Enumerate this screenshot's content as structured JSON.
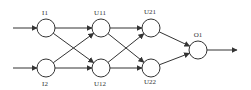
{
  "diagram": {
    "type": "neural-network",
    "colors": {
      "stroke": "#333333",
      "background": "#ffffff"
    },
    "nodes": [
      {
        "id": "I1",
        "label": "I1",
        "cx": 46,
        "cy": 28,
        "r": 9,
        "lx": 45,
        "ly": 15
      },
      {
        "id": "I2",
        "label": "I2",
        "cx": 46,
        "cy": 68,
        "r": 9,
        "lx": 45,
        "ly": 86
      },
      {
        "id": "U11",
        "label": "U11",
        "cx": 101,
        "cy": 28,
        "r": 9,
        "lx": 100,
        "ly": 15
      },
      {
        "id": "U12",
        "label": "U12",
        "cx": 101,
        "cy": 68,
        "r": 9,
        "lx": 100,
        "ly": 86
      },
      {
        "id": "U21",
        "label": "U21",
        "cx": 151,
        "cy": 28,
        "r": 9,
        "lx": 150,
        "ly": 14
      },
      {
        "id": "U22",
        "label": "U22",
        "cx": 151,
        "cy": 68,
        "r": 9,
        "lx": 150,
        "ly": 84
      },
      {
        "id": "O1",
        "label": "O1",
        "cx": 198,
        "cy": 50,
        "r": 9,
        "lx": 198,
        "ly": 37
      }
    ],
    "edges": [
      {
        "from": "input-1",
        "to": "I1"
      },
      {
        "from": "input-2",
        "to": "I2"
      },
      {
        "from": "I1",
        "to": "U11"
      },
      {
        "from": "I1",
        "to": "U12"
      },
      {
        "from": "I2",
        "to": "U11"
      },
      {
        "from": "I2",
        "to": "U12"
      },
      {
        "from": "U11",
        "to": "U21"
      },
      {
        "from": "U11",
        "to": "U22"
      },
      {
        "from": "U12",
        "to": "U21"
      },
      {
        "from": "U12",
        "to": "U22"
      },
      {
        "from": "U21",
        "to": "O1"
      },
      {
        "from": "U22",
        "to": "O1"
      },
      {
        "from": "O1",
        "to": "output"
      }
    ]
  }
}
